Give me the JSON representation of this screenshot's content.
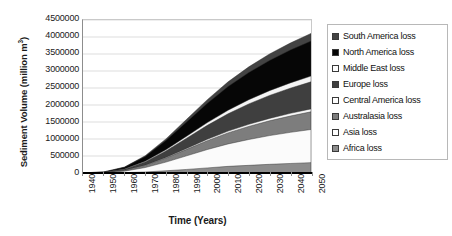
{
  "chart_data": {
    "type": "area",
    "title": "",
    "xlabel": "Time (Years)",
    "ylabel": "Sediment Volume (million m",
    "ylabel_sup": "3",
    "ylabel_tail": ")",
    "stacked": true,
    "grid": true,
    "legend_position": "right",
    "x": [
      1940,
      1950,
      1960,
      1970,
      1980,
      1990,
      2000,
      2010,
      2020,
      2030,
      2040,
      2050
    ],
    "xtick_labels": [
      "1940",
      "1950",
      "1960",
      "1970",
      "1980",
      "1990",
      "2000",
      "2010",
      "2020",
      "2030",
      "2040",
      "2050"
    ],
    "xlim": [
      1940,
      2050
    ],
    "ylim": [
      0,
      4500000
    ],
    "ytick_labels": [
      "4500000",
      "4000000",
      "3500000",
      "3000000",
      "2500000",
      "2000000",
      "1500000",
      "1000000",
      "500000",
      "0"
    ],
    "ytick_values": [
      4500000,
      4000000,
      3500000,
      3000000,
      2500000,
      2000000,
      1500000,
      1000000,
      500000,
      0
    ],
    "stack_order_bottom_to_top": [
      "Africa loss",
      "Asia loss",
      "Australasia loss",
      "Central America loss",
      "Europe loss",
      "Middle East loss",
      "North America loss",
      "South America loss"
    ],
    "series": [
      {
        "name": "Africa loss",
        "color": "#8c8c8c",
        "values": [
          0,
          2000,
          10000,
          30000,
          65000,
          105000,
          150000,
          195000,
          225000,
          255000,
          280000,
          305000
        ]
      },
      {
        "name": "Asia loss",
        "color": "#fbfbfb",
        "values": [
          1000,
          8000,
          45000,
          130000,
          255000,
          400000,
          540000,
          660000,
          760000,
          845000,
          915000,
          975000
        ]
      },
      {
        "name": "Australasia loss",
        "color": "#7d7d7d",
        "values": [
          500,
          4000,
          22000,
          62000,
          120000,
          190000,
          260000,
          325000,
          385000,
          435000,
          480000,
          520000
        ]
      },
      {
        "name": "Central America loss",
        "color": "#f7f7f7",
        "values": [
          100,
          600,
          3000,
          9000,
          18000,
          29000,
          41000,
          52000,
          62000,
          71000,
          79000,
          86000
        ]
      },
      {
        "name": "Europe loss",
        "color": "#3f3f3f",
        "values": [
          800,
          6000,
          32000,
          95000,
          190000,
          300000,
          410000,
          510000,
          600000,
          675000,
          740000,
          795000
        ]
      },
      {
        "name": "Middle East loss",
        "color": "#f4f4f4",
        "values": [
          200,
          1200,
          6000,
          18000,
          36000,
          58000,
          82000,
          104000,
          124000,
          141000,
          156000,
          169000
        ]
      },
      {
        "name": "North America loss",
        "color": "#060606",
        "values": [
          1200,
          9000,
          48000,
          140000,
          270000,
          420000,
          565000,
          695000,
          800000,
          890000,
          965000,
          1030000
        ]
      },
      {
        "name": "South America loss",
        "color": "#434343",
        "values": [
          200,
          1500,
          8000,
          24000,
          48000,
          78000,
          110000,
          140000,
          166000,
          188000,
          207000,
          225000
        ]
      }
    ],
    "total_values": [
      4000,
      32200,
      174000,
      508000,
      1002000,
      1580000,
      2158000,
      2681000,
      3122000,
      3500000,
      3822000,
      4105000
    ]
  },
  "legend": {
    "items": [
      {
        "label": "South America loss",
        "color": "#434343"
      },
      {
        "label": "North America loss",
        "color": "#060606"
      },
      {
        "label": "Middle East loss",
        "color": "#fdfdfd"
      },
      {
        "label": "Europe loss",
        "color": "#3f3f3f"
      },
      {
        "label": "Central America loss",
        "color": "#fdfdfd"
      },
      {
        "label": "Australasia loss",
        "color": "#7d7d7d"
      },
      {
        "label": "Asia loss",
        "color": "#ffffff"
      },
      {
        "label": "Africa loss",
        "color": "#8c8c8c"
      }
    ]
  }
}
